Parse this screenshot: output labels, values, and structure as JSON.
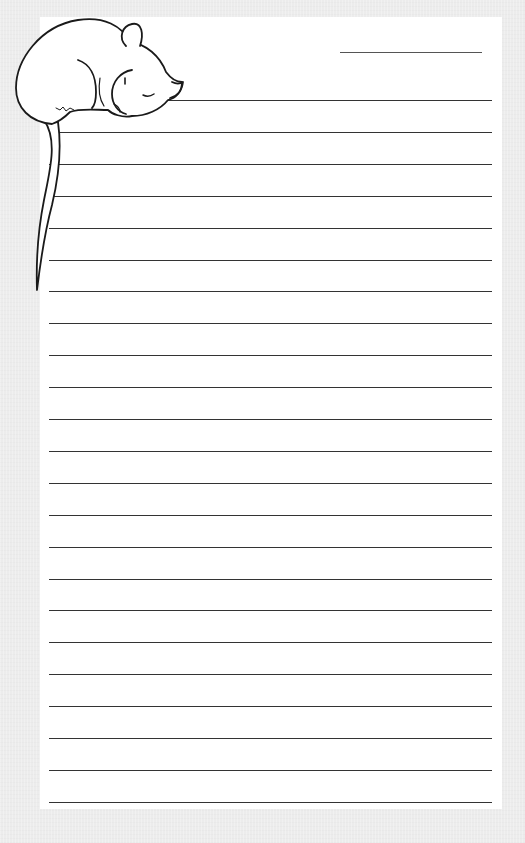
{
  "page": {
    "type": "lined-stationery",
    "background_color": "#ececec",
    "paper_color": "#ffffff",
    "line_color": "#333333"
  },
  "header": {
    "name_line": {
      "label": "",
      "x": 340,
      "y": 52,
      "width": 142
    }
  },
  "illustration": {
    "icon": "sleeping-mouse-icon",
    "description": "Sleeping mouse curled on the top-left corner with tail hanging down the left margin"
  },
  "rules": {
    "count": 23,
    "first_y": 100,
    "spacing": 31.9,
    "x_start": 49,
    "x_end": 492
  }
}
